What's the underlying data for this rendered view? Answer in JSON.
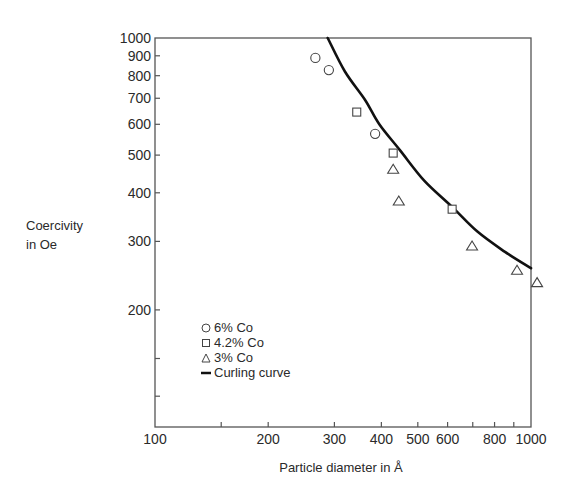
{
  "chart_data": {
    "type": "scatter",
    "title": "",
    "xlabel": "Particle diameter in Å",
    "ylabel": "Coercivity in Oe",
    "xscale": "log",
    "yscale": "log",
    "xlim": [
      100,
      1000
    ],
    "ylim": [
      100,
      1000
    ],
    "grid": false,
    "legend_position": "lower-left inside",
    "x_ticks": [
      100,
      150,
      200,
      300,
      400,
      500,
      600,
      700,
      800,
      900,
      1000
    ],
    "x_tick_labels": [
      "100",
      "",
      "200",
      "300",
      "400",
      "500",
      "600",
      "",
      "800",
      "",
      "1000"
    ],
    "y_ticks": [
      100,
      120,
      150,
      200,
      300,
      400,
      500,
      600,
      700,
      800,
      900,
      1000
    ],
    "y_tick_labels": [
      "",
      "",
      "",
      "200",
      "300",
      "400",
      "500",
      "600",
      "700",
      "800",
      "900",
      "1000"
    ],
    "series": [
      {
        "name": "6% Co",
        "marker": "circle",
        "points": [
          [
            267,
            889
          ],
          [
            290,
            827
          ],
          [
            385,
            567
          ]
        ]
      },
      {
        "name": "4.2% Co",
        "marker": "square",
        "points": [
          [
            344,
            645
          ],
          [
            430,
            506
          ],
          [
            617,
            363
          ]
        ]
      },
      {
        "name": "3% Co",
        "marker": "triangle",
        "points": [
          [
            430,
            460
          ],
          [
            445,
            381
          ],
          [
            697,
            292
          ],
          [
            918,
            253
          ],
          [
            1038,
            235
          ]
        ]
      },
      {
        "name": "Curling curve",
        "marker": "line",
        "points": [
          [
            288,
            1000
          ],
          [
            320,
            820
          ],
          [
            362,
            693
          ],
          [
            395,
            600
          ],
          [
            448,
            515
          ],
          [
            520,
            430
          ],
          [
            617,
            368
          ],
          [
            720,
            318
          ],
          [
            853,
            282
          ],
          [
            1000,
            256
          ]
        ]
      }
    ]
  },
  "labels": {
    "ylabel_line1": "Coercivity",
    "ylabel_line2": "in Oe",
    "xlabel": "Particle diameter in Å"
  },
  "legend": [
    {
      "symbol": "circle",
      "label": "6% Co"
    },
    {
      "symbol": "square",
      "label": "4.2% Co"
    },
    {
      "symbol": "triangle",
      "label": "3% Co"
    },
    {
      "symbol": "line",
      "label": "Curling curve"
    }
  ]
}
